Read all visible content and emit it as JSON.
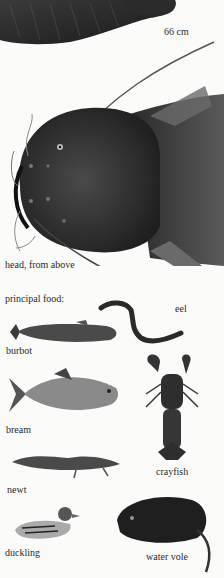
{
  "page": {
    "background": "#fbfbf9"
  },
  "top": {
    "size_label": "66 cm"
  },
  "head": {
    "caption": "head, from above"
  },
  "food": {
    "heading": "principal food:",
    "items": [
      {
        "label": "eel"
      },
      {
        "label": "burbot"
      },
      {
        "label": "bream"
      },
      {
        "label": "crayfish"
      },
      {
        "label": "newt"
      },
      {
        "label": "duckling"
      },
      {
        "label": "water vole"
      }
    ]
  }
}
